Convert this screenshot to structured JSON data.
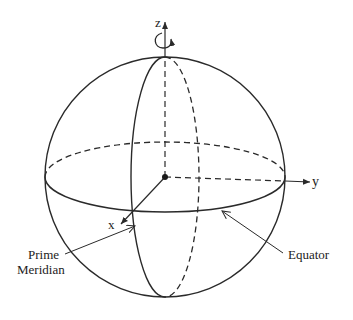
{
  "diagram": {
    "type": "sphere-coordinate-system",
    "axes": {
      "x": "x",
      "y": "y",
      "z": "z"
    },
    "labels": {
      "prime_meridian_line1": "Prime",
      "prime_meridian_line2": "Meridian",
      "equator": "Equator"
    },
    "rotation_indicator": "rotation-about-z-axis",
    "colors": {
      "stroke": "#2a2a2a",
      "background": "#ffffff"
    }
  }
}
